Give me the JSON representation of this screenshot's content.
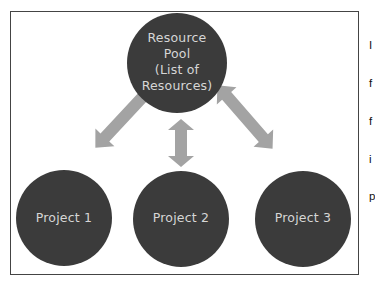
{
  "diagram": {
    "colors": {
      "node_fill": "#3b3b3b",
      "node_text": "#d6d6d6",
      "arrow_fill": "#a3a3a3",
      "frame_border": "#444444",
      "background": "#ffffff"
    },
    "pool": {
      "label_lines": [
        "Resource",
        "Pool",
        "(List of",
        "Resources)"
      ]
    },
    "projects": [
      {
        "label": "Project 1"
      },
      {
        "label": "Project 2"
      },
      {
        "label": "Project 3"
      }
    ],
    "arrows": [
      {
        "from": "pool",
        "to": "project-1",
        "type": "double-headed"
      },
      {
        "from": "pool",
        "to": "project-2",
        "type": "double-headed"
      },
      {
        "from": "pool",
        "to": "project-3",
        "type": "double-headed"
      }
    ]
  },
  "side_text": {
    "lines": [
      "I",
      "f",
      "f",
      "i",
      "p"
    ]
  }
}
